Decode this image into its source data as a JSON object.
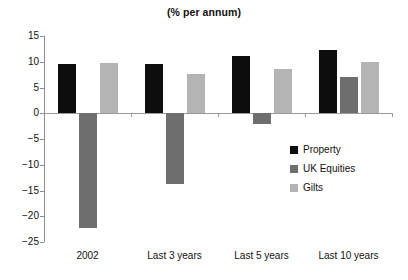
{
  "chart_data": {
    "type": "bar",
    "title": "(% per annum)",
    "subtitle": "",
    "xlabel": "",
    "ylabel": "",
    "categories": [
      "2002",
      "Last 3 years",
      "Last 5 years",
      "Last 10 years"
    ],
    "series": [
      {
        "name": "Property",
        "color": "#0d0d0d",
        "values": [
          9.6,
          9.5,
          11.2,
          12.3
        ]
      },
      {
        "name": "UK Equities",
        "color": "#6e6e6e",
        "values": [
          -22.2,
          -13.8,
          -2.1,
          7.0
        ]
      },
      {
        "name": "Gilts",
        "color": "#b4b4b4",
        "values": [
          9.8,
          7.7,
          8.5,
          10.0
        ]
      }
    ],
    "ylim": [
      -25,
      15
    ],
    "ytick_step": 5,
    "ytick_labels": [
      "15",
      "10",
      "5",
      "0",
      "−5",
      "−10",
      "−15",
      "−20",
      "−25"
    ],
    "ytick_values": [
      15,
      10,
      5,
      0,
      -5,
      -10,
      -15,
      -20,
      -25
    ],
    "grid": false,
    "legend_position": "right-middle",
    "annotations": []
  }
}
